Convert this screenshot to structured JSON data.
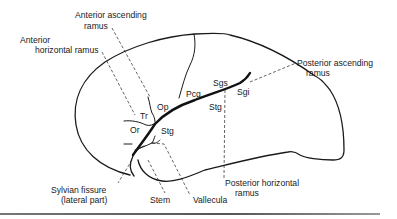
{
  "figure": {
    "labels": {
      "anterior_ascending_ramus": [
        "Anterior ascending",
        "ramus"
      ],
      "anterior_horizontal_ramus": [
        "Anterior",
        "horizontal ramus"
      ],
      "posterior_ascending_ramus": [
        "Posterior ascending",
        "ramus"
      ],
      "posterior_horizontal_ramus": [
        "Posterior horizontal",
        "ramus"
      ],
      "sylvian_fissure": [
        "Sylvian fissure",
        "(lateral part)"
      ],
      "stem": "Stem",
      "vallecula": "Vallecula"
    },
    "abbreviations": {
      "op": "Op",
      "tr": "Tr",
      "or": "Or",
      "pcg": "Pcg",
      "sgs": "Sgs",
      "sgi": "Sgi",
      "stg_upper": "Stg",
      "stg_lower": "Stg"
    }
  }
}
